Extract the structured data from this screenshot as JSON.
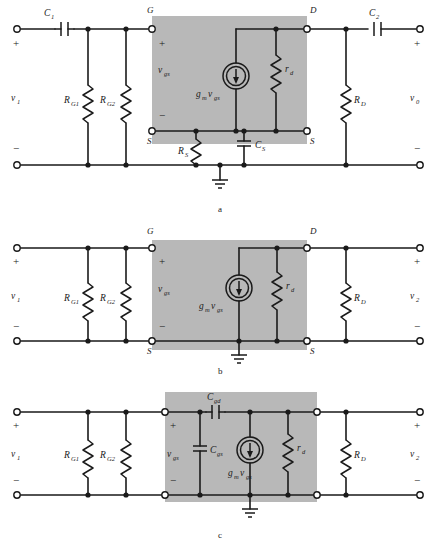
{
  "figure": {
    "panels": [
      {
        "id": "a",
        "caption": "a",
        "labels": {
          "input_source": "v",
          "input_source_sub": "1",
          "output_source": "v",
          "output_source_sub": "0",
          "coupling_cap_in": "C",
          "coupling_cap_in_sub": "1",
          "coupling_cap_out": "C",
          "coupling_cap_out_sub": "2",
          "gate_res_1": "R",
          "gate_res_1_sub": "G1",
          "gate_res_2": "R",
          "gate_res_2_sub": "G2",
          "drain_res": "R",
          "drain_res_sub": "D",
          "source_res": "R",
          "source_res_sub": "S",
          "source_cap": "C",
          "source_cap_sub": "S",
          "drain_resistance": "r",
          "drain_resistance_sub": "d",
          "gate_node": "G",
          "drain_node": "D",
          "source_node_left": "S",
          "source_node_right": "S",
          "vgs": "v",
          "vgs_sub": "gs",
          "current_source": "g",
          "current_source_sub1": "m",
          "current_source_mid": "v",
          "current_source_sub2": "gs",
          "plus": "+",
          "minus": "−"
        }
      },
      {
        "id": "b",
        "caption": "b",
        "labels": {
          "input_source": "v",
          "input_source_sub": "1",
          "output_source": "v",
          "output_source_sub": "2",
          "gate_res_1": "R",
          "gate_res_1_sub": "G1",
          "gate_res_2": "R",
          "gate_res_2_sub": "G2",
          "drain_res": "R",
          "drain_res_sub": "D",
          "drain_resistance": "r",
          "drain_resistance_sub": "d",
          "gate_node": "G",
          "drain_node": "D",
          "source_node_left": "S",
          "source_node_right": "S",
          "vgs": "v",
          "vgs_sub": "gs",
          "current_source": "g",
          "current_source_sub1": "m",
          "current_source_mid": "v",
          "current_source_sub2": "gs",
          "plus": "+",
          "minus": "−"
        }
      },
      {
        "id": "c",
        "caption": "c",
        "labels": {
          "input_source": "v",
          "input_source_sub": "1",
          "output_source": "v",
          "output_source_sub": "2",
          "gate_res_1": "R",
          "gate_res_1_sub": "G1",
          "gate_res_2": "R",
          "gate_res_2_sub": "G2",
          "drain_res": "R",
          "drain_res_sub": "D",
          "drain_resistance": "r",
          "drain_resistance_sub": "d",
          "cap_gd": "C",
          "cap_gd_sub": "gd",
          "cap_gs": "C",
          "cap_gs_sub": "gs",
          "vgs": "v",
          "vgs_sub": "gs",
          "current_source": "g",
          "current_source_sub1": "m",
          "current_source_mid": "v",
          "current_source_sub2": "gs",
          "plus": "+",
          "minus": "−"
        }
      }
    ],
    "colors": {
      "line": "#1a1a1a",
      "shade": "#b8b8b8",
      "background": "#ffffff"
    }
  }
}
